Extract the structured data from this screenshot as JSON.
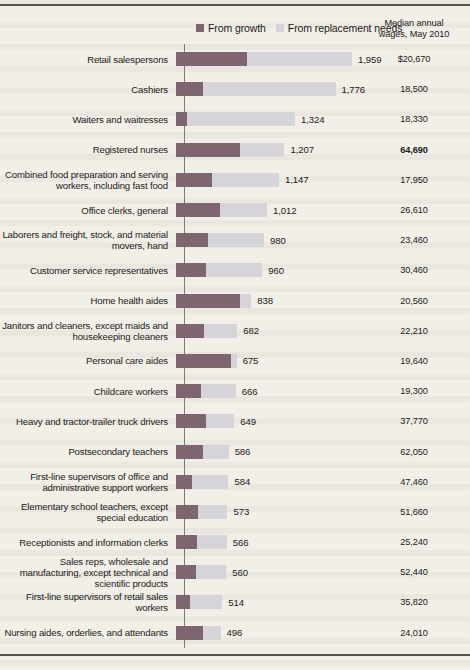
{
  "legend": {
    "growth_label": "From growth",
    "replacement_label": "From replacement needs"
  },
  "wage_column_header": "Median annual\nwages, May 2010",
  "wage_column_header_line1": "Median annual",
  "wage_column_header_line2": "wages, May 2010",
  "colors": {
    "growth": "#7d6670",
    "replacement": "#d6d3d9",
    "paper": "#f2efe9",
    "ink": "#1d1a18"
  },
  "chart_data": {
    "type": "bar",
    "title": "",
    "subtype": "stacked-horizontal",
    "xlabel": "",
    "ylabel": "",
    "legend_position": "top",
    "grid": false,
    "value_unit": "thousands of job openings",
    "categories": [
      "Retail salespersons",
      "Cashiers",
      "Waiters and waitresses",
      "Registered nurses",
      "Combined food preparation and serving workers, including fast food",
      "Office clerks, general",
      "Laborers and freight, stock, and material movers, hand",
      "Customer service representatives",
      "Home health aides",
      "Janitors and cleaners, except maids and housekeeping cleaners",
      "Personal care aides",
      "Childcare workers",
      "Heavy and tractor-trailer truck drivers",
      "Postsecondary teachers",
      "First-line supervisors of office and administrative support workers",
      "Elementary school teachers, except special education",
      "Receptionists and information clerks",
      "Sales reps, wholesale and manufacturing, except technical and scientific products",
      "First-line supervisors of retail sales workers",
      "Nursing aides, orderlies, and attendants"
    ],
    "totals": [
      1959,
      1776,
      1324,
      1207,
      1147,
      1012,
      980,
      960,
      838,
      682,
      675,
      666,
      649,
      586,
      584,
      573,
      566,
      560,
      514,
      496
    ],
    "total_labels": [
      "1,959",
      "1,776",
      "1,324",
      "1,207",
      "1,147",
      "1,012",
      "980",
      "960",
      "838",
      "682",
      "675",
      "666",
      "649",
      "586",
      "584",
      "573",
      "566",
      "560",
      "514",
      "496"
    ],
    "series": [
      {
        "name": "From growth",
        "color": "#7d6670",
        "values": [
          790,
          300,
          125,
          712,
          398,
          489,
          360,
          338,
          711,
          312,
          607,
          280,
          330,
          305,
          176,
          248,
          235,
          223,
          158,
          302
        ]
      },
      {
        "name": "From replacement needs",
        "color": "#d6d3d9",
        "values": [
          1169,
          1476,
          1199,
          495,
          749,
          523,
          620,
          622,
          127,
          370,
          68,
          386,
          319,
          281,
          408,
          325,
          331,
          337,
          356,
          194
        ]
      }
    ],
    "wages": [
      "$20,670",
      "18,500",
      "18,330",
      "64,690",
      "17,950",
      "26,610",
      "23,460",
      "30,460",
      "20,560",
      "22,210",
      "19,640",
      "19,300",
      "37,770",
      "62,050",
      "47,460",
      "51,660",
      "25,240",
      "52,440",
      "35,820",
      "24,010"
    ],
    "wage_bold_index": 3,
    "x_max": 1959
  }
}
